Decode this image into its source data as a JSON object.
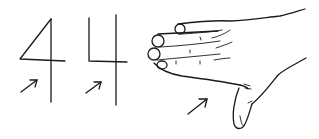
{
  "illustration": {
    "description": "Hand-drawn sketches: an open-style digit four, a closed-style digit four, and a hand gesture forming a four, each with a pointing arrow",
    "figures": [
      {
        "id": "four-open",
        "label": "4",
        "style": "triangular"
      },
      {
        "id": "four-closed",
        "label": "4",
        "style": "squared"
      },
      {
        "id": "hand-four",
        "label": "hand",
        "style": "four fingers extended, thumb down"
      }
    ],
    "arrow_count": 3,
    "ink_color": "#1a1a1a",
    "background": "#ffffff"
  }
}
